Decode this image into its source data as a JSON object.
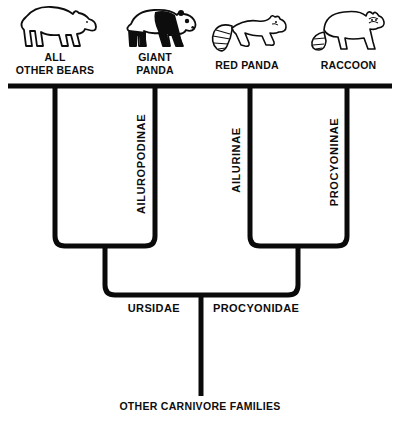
{
  "diagram": {
    "taxa": [
      {
        "name": "ALL\nOTHER BEARS",
        "icon": "bear-icon"
      },
      {
        "name": "GIANT\nPANDA",
        "icon": "giant-panda-icon"
      },
      {
        "name": "RED PANDA",
        "icon": "red-panda-icon"
      },
      {
        "name": "RACCOON",
        "icon": "raccoon-icon"
      }
    ],
    "subfamilies": [
      {
        "label": "AILUROPODINAE"
      },
      {
        "label": "AILURINAE"
      },
      {
        "label": "PROCYONINAE"
      }
    ],
    "families": [
      {
        "label": "URSIDAE"
      },
      {
        "label": "PROCYONIDAE"
      }
    ],
    "root_label": "OTHER CARNIVORE FAMILIES",
    "colors": {
      "line": "#0a0a0a",
      "background": "#ffffff"
    }
  }
}
